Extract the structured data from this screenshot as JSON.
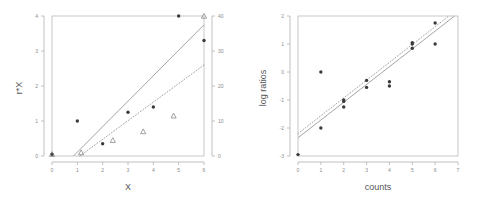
{
  "figure": {
    "panel_count": 2,
    "background_color": "#ffffff"
  },
  "chart_data": [
    {
      "type": "scatter",
      "panel": "left",
      "title": "",
      "xlabel": "X",
      "ylabel": "r*X",
      "xlim": [
        0,
        6
      ],
      "ylim": [
        0,
        4
      ],
      "xticks": [
        0,
        1,
        2,
        3,
        4,
        5,
        6
      ],
      "xtick_labels": [
        "0",
        "1",
        "2",
        "3",
        "4",
        "5",
        "6"
      ],
      "yticks": [
        0,
        1,
        2,
        3,
        4
      ],
      "ytick_labels": [
        "0",
        "1",
        "2",
        "3",
        "4"
      ],
      "secondary_axis": {
        "position": "right",
        "ticks": [
          0,
          10,
          20,
          30,
          40
        ],
        "tick_labels": [
          "0",
          "10",
          "20",
          "30",
          "40"
        ],
        "lim": [
          0,
          40
        ]
      },
      "grid": false,
      "legend": "none",
      "series": [
        {
          "name": "filled circles",
          "marker": "circle-filled",
          "color": "#3a3a3a",
          "points": [
            [
              0.0,
              0.05
            ],
            [
              1.0,
              1.0
            ],
            [
              2.0,
              0.35
            ],
            [
              3.0,
              1.25
            ],
            [
              4.0,
              1.4
            ],
            [
              5.0,
              4.0
            ],
            [
              6.0,
              3.3
            ]
          ]
        },
        {
          "name": "open triangles",
          "marker": "triangle-open",
          "color": "#7a7a7a",
          "points": [
            [
              0.0,
              0.05
            ],
            [
              1.15,
              0.1
            ],
            [
              2.4,
              0.45
            ],
            [
              3.6,
              0.7
            ],
            [
              4.8,
              1.15
            ],
            [
              6.0,
              4.0
            ]
          ]
        }
      ],
      "lines": [
        {
          "name": "solid reference line",
          "style": "solid",
          "color": "#9a9a9a",
          "from": [
            0.85,
            0.0
          ],
          "to": [
            6.0,
            3.75
          ]
        },
        {
          "name": "dotted reference line",
          "style": "dotted",
          "color": "#9a9a9a",
          "from": [
            1.1,
            0.0
          ],
          "to": [
            6.0,
            2.6
          ]
        }
      ]
    },
    {
      "type": "scatter",
      "panel": "right",
      "title": "",
      "xlabel": "counts",
      "ylabel": "log ratios",
      "xlim": [
        0,
        7
      ],
      "ylim": [
        -3,
        2
      ],
      "xticks": [
        0,
        1,
        2,
        3,
        4,
        5,
        6,
        7
      ],
      "xtick_labels": [
        "0",
        "1",
        "2",
        "3",
        "4",
        "5",
        "6",
        "7"
      ],
      "yticks": [
        -3,
        -2,
        -1,
        0,
        1,
        2
      ],
      "ytick_labels": [
        "-3",
        "-2",
        "-1",
        "0",
        "1",
        "2"
      ],
      "grid": false,
      "legend": "none",
      "series": [
        {
          "name": "log ratio observations",
          "marker": "circle-filled",
          "color": "#3a3a3a",
          "points": [
            [
              0.0,
              -2.95
            ],
            [
              1.0,
              -2.0
            ],
            [
              1.0,
              0.0
            ],
            [
              2.0,
              -1.05
            ],
            [
              2.0,
              -1.0
            ],
            [
              2.0,
              -1.25
            ],
            [
              3.0,
              -0.3
            ],
            [
              3.0,
              -0.55
            ],
            [
              4.0,
              -0.35
            ],
            [
              4.0,
              -0.5
            ],
            [
              5.0,
              0.85
            ],
            [
              5.0,
              1.0
            ],
            [
              5.0,
              1.05
            ],
            [
              6.0,
              1.75
            ],
            [
              6.0,
              1.0
            ]
          ]
        }
      ],
      "lines": [
        {
          "name": "solid regression line",
          "style": "solid",
          "color": "#9a9a9a",
          "from": [
            0.0,
            -2.35
          ],
          "to": [
            6.85,
            2.0
          ]
        },
        {
          "name": "dotted regression line",
          "style": "dotted",
          "color": "#9a9a9a",
          "from": [
            0.0,
            -2.2
          ],
          "to": [
            6.6,
            2.0
          ]
        }
      ]
    }
  ]
}
